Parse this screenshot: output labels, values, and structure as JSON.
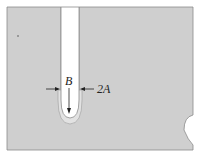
{
  "figure": {
    "labels": {
      "tip_radius": "B",
      "notch_width": "2A"
    },
    "colors": {
      "plate": "#cfcfcf",
      "plastic_zone": "#e2e2e2",
      "edge": "#8a8a8a",
      "background": "#ffffff",
      "ink": "#222222"
    }
  }
}
